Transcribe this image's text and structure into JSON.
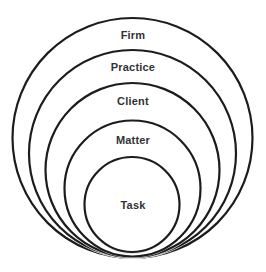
{
  "diagram": {
    "type": "nested-circles",
    "colors": {
      "stroke": "#1c1c1c",
      "text": "#333333",
      "background": "#ffffff"
    },
    "levels": [
      {
        "label": "Firm"
      },
      {
        "label": "Practice"
      },
      {
        "label": "Client"
      },
      {
        "label": "Matter"
      },
      {
        "label": "Task"
      }
    ]
  }
}
